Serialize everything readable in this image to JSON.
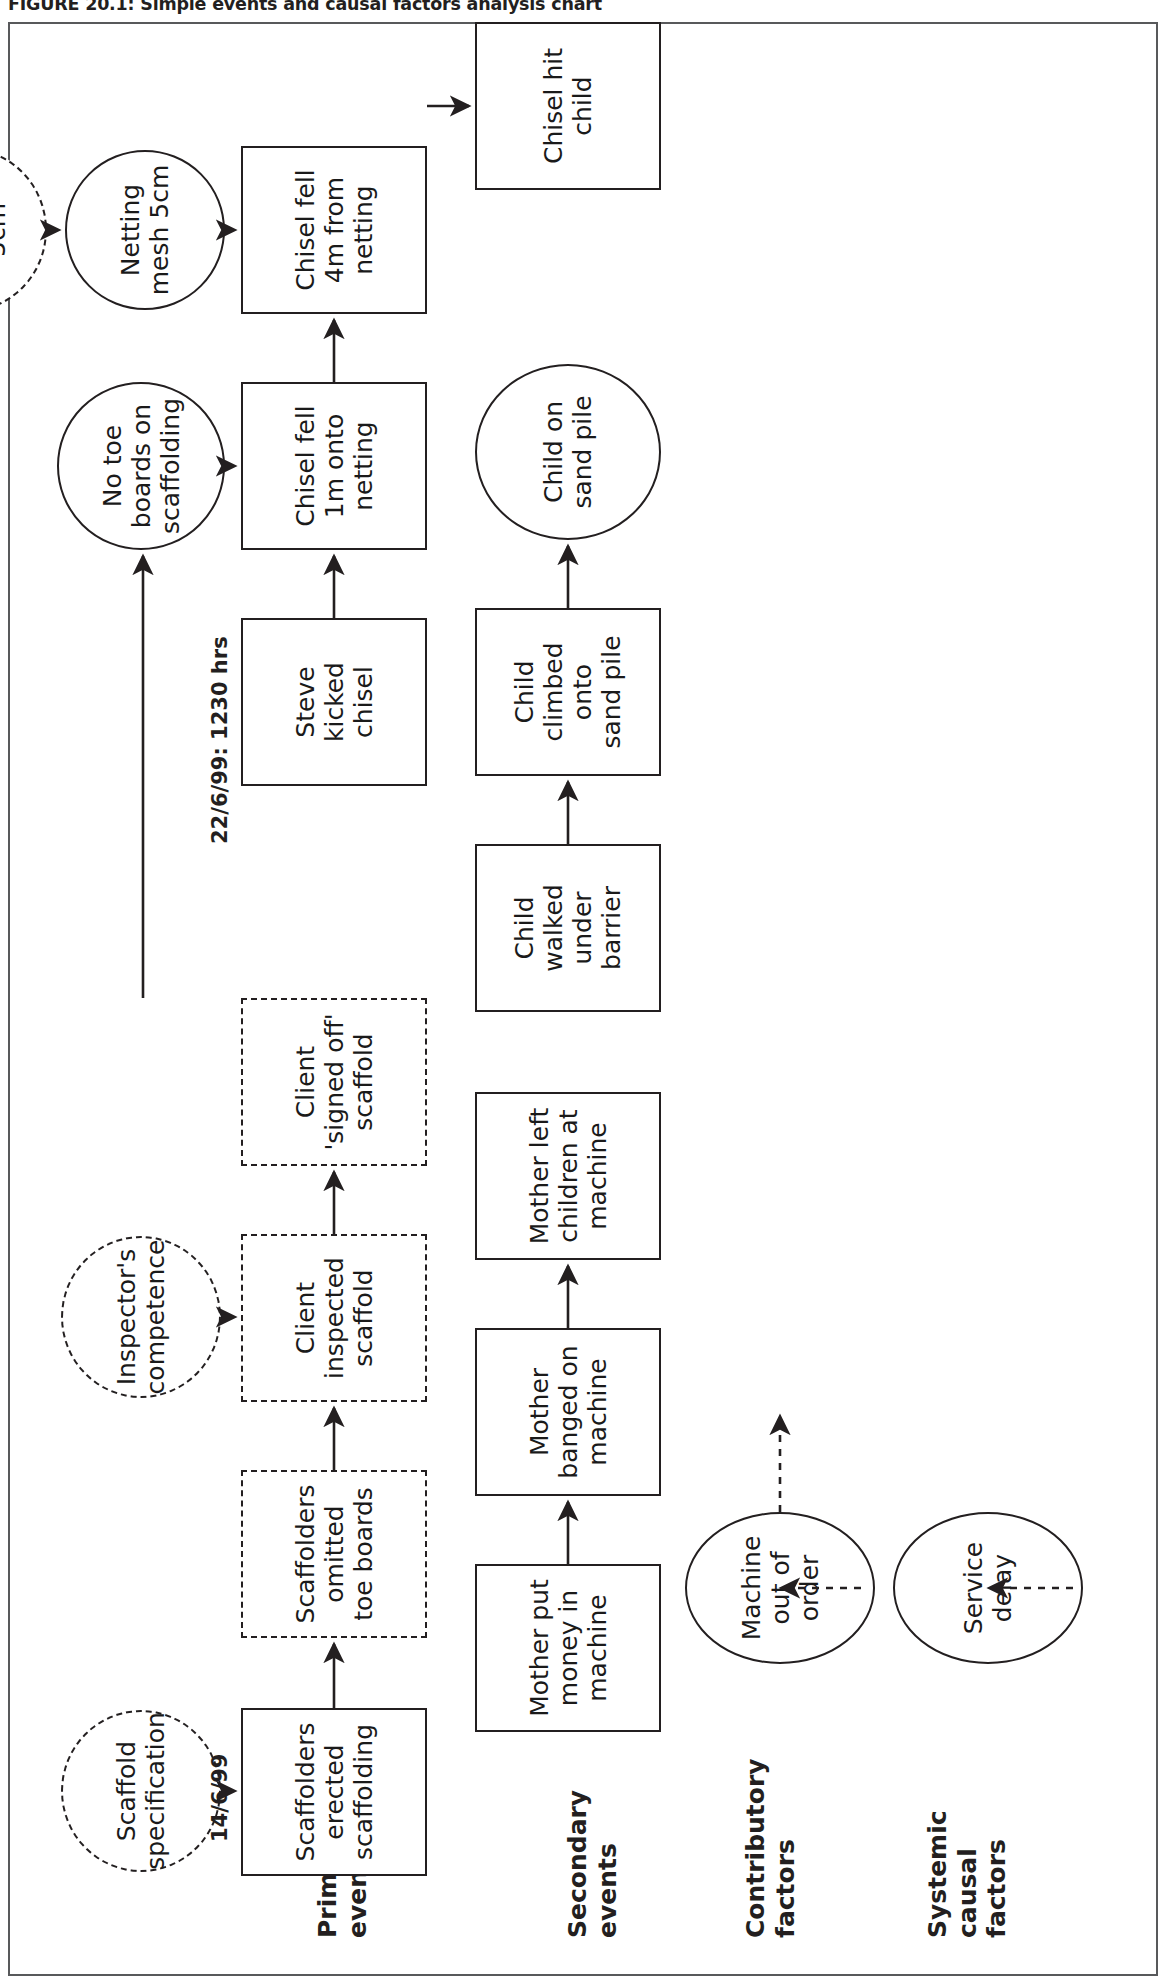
{
  "figure": {
    "title": "FIGURE 20.1: Simple events and causal factors analysis chart"
  },
  "lanes": [
    {
      "id": "systemic",
      "label": "Systemic\ncausal\nfactors"
    },
    {
      "id": "contributory",
      "label": "Contributory\nfactors"
    },
    {
      "id": "secondary",
      "label": "Secondary\nevents"
    },
    {
      "id": "primary",
      "label": "Primary\nevents"
    }
  ],
  "nodes": {
    "service_delay": "Service\ndelay",
    "machine_out_of_order": "Machine\nout of\norder",
    "mother_put_money": "Mother put\nmoney in\nmachine",
    "mother_banged": "Mother\nbanged on\nmachine",
    "mother_left_children": "Mother left\nchildren at\nmachine",
    "child_walked_under": "Child\nwalked\nunder\nbarrier",
    "child_climbed_onto": "Child\nclimbed\nonto\nsand pile",
    "child_on_sand_pile": "Child on\nsand pile",
    "scaffolders_erected": "Scaffolders\nerected\nscaffolding",
    "scaffold_specification": "Scaffold\nspecification",
    "scaffolders_omitted": "Scaffolders\nomitted\ntoe boards",
    "client_inspected": "Client\ninspected\nscaffold",
    "inspectors_competence": "Inspector's\ncompetence",
    "client_signed_off": "Client\n'signed off'\nscaffold",
    "no_toe_boards": "No toe\nboards on\nscaffolding",
    "steve_kicked_chisel": "Steve\nkicked\nchisel",
    "chisel_fell_1m": "Chisel fell\n1m onto\nnetting",
    "chisel_fell_4m": "Chisel fell\n4m from\nnetting",
    "netting_mesh": "Netting\nmesh 5cm",
    "netting_specification": "Netting\nspecification\n5cm",
    "chisel_hit_child": "Chisel hit\nchild"
  },
  "time_labels": {
    "start_date": "14/6/99",
    "incident_datetime": "22/6/99: 1230 hrs"
  },
  "colors": {
    "stroke": "#231f20",
    "frame": "#58595b",
    "background": "#ffffff",
    "text": "#1a1a1a"
  }
}
